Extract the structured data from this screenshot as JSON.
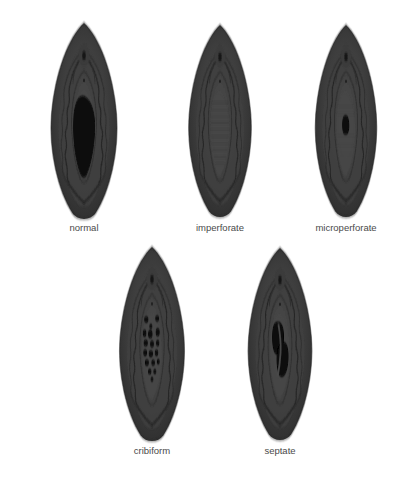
{
  "diagram": {
    "background_color": "#ffffff",
    "label_color": "#4a4a4a",
    "palette": {
      "outer_tissue": "#3a3a3a",
      "outer_tissue_dark": "#2e2e2e",
      "mid_tissue": "#434343",
      "inner_tissue": "#4a4a4a",
      "vestibule": "#3f3f3f",
      "fold_line": "#232323",
      "opening": "#0a0a0a",
      "highlight": "#565656"
    },
    "rows": [
      {
        "row_index": 0,
        "figures": [
          {
            "label": "normal",
            "center_x": 84,
            "center_y": 122,
            "width": 122,
            "height": 205,
            "label_x": 84,
            "label_y": 226,
            "opening_type": "single-large",
            "opening": {
              "shape": "irregular-oval",
              "cx": 84,
              "cy": 128,
              "rx": 16,
              "ry": 36
            }
          },
          {
            "label": "imperforate",
            "center_x": 220,
            "center_y": 122,
            "width": 116,
            "height": 200,
            "label_x": 220,
            "label_y": 226,
            "opening_type": "none",
            "opening": null,
            "striations": true
          },
          {
            "label": "microperforate",
            "center_x": 346,
            "center_y": 122,
            "width": 114,
            "height": 200,
            "label_x": 346,
            "label_y": 226,
            "opening_type": "single-tiny",
            "opening": {
              "shape": "slit",
              "cx": 345,
              "cy": 125,
              "rx": 4,
              "ry": 9
            }
          }
        ]
      },
      {
        "row_index": 1,
        "figures": [
          {
            "label": "cribiform",
            "center_x": 152,
            "center_y": 345,
            "width": 120,
            "height": 202,
            "label_x": 152,
            "label_y": 449,
            "opening_type": "multiple-small",
            "perforations": [
              {
                "cx": 146,
                "cy": 320,
                "r": 3.4
              },
              {
                "cx": 157,
                "cy": 319,
                "r": 3.0
              },
              {
                "cx": 139,
                "cy": 329,
                "r": 2.6
              },
              {
                "cx": 150,
                "cy": 329,
                "r": 3.6
              },
              {
                "cx": 160,
                "cy": 330,
                "r": 3.2
              },
              {
                "cx": 143,
                "cy": 338,
                "r": 3.4
              },
              {
                "cx": 154,
                "cy": 339,
                "r": 3.0
              },
              {
                "cx": 163,
                "cy": 340,
                "r": 2.8
              },
              {
                "cx": 140,
                "cy": 347,
                "r": 3.0
              },
              {
                "cx": 151,
                "cy": 348,
                "r": 3.4
              },
              {
                "cx": 161,
                "cy": 349,
                "r": 2.8
              },
              {
                "cx": 145,
                "cy": 356,
                "r": 3.2
              },
              {
                "cx": 156,
                "cy": 356,
                "r": 3.0
              },
              {
                "cx": 148,
                "cy": 364,
                "r": 3.0
              },
              {
                "cx": 158,
                "cy": 364,
                "r": 2.6
              },
              {
                "cx": 152,
                "cy": 371,
                "r": 2.6
              }
            ]
          },
          {
            "label": "septate",
            "center_x": 280,
            "center_y": 345,
            "width": 118,
            "height": 200,
            "label_x": 280,
            "label_y": 449,
            "opening_type": "two-divided",
            "openings": [
              {
                "shape": "kidney-left",
                "cx": 272,
                "cy": 327,
                "rx": 10,
                "ry": 17
              },
              {
                "shape": "kidney-right",
                "cx": 284,
                "cy": 352,
                "rx": 10,
                "ry": 17
              }
            ]
          }
        ]
      }
    ]
  }
}
